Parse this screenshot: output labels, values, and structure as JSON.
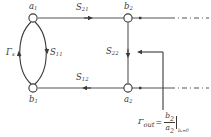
{
  "figure": {
    "type": "signal-flow-graph",
    "title": "",
    "nodes": [
      {
        "id": "a1",
        "label": "a",
        "sub": "1",
        "x": 33,
        "y": 18
      },
      {
        "id": "b1",
        "label": "b",
        "sub": "1",
        "x": 33,
        "y": 88
      },
      {
        "id": "b2",
        "label": "b",
        "sub": "2",
        "x": 128,
        "y": 18
      },
      {
        "id": "a2",
        "label": "a",
        "sub": "2",
        "x": 128,
        "y": 88
      }
    ],
    "branches": [
      {
        "id": "gamma_s",
        "label": "Γ",
        "sub": "s",
        "from": "b1",
        "to": "a1",
        "shape": "arc-left"
      },
      {
        "id": "s11",
        "label": "S",
        "sub": "11",
        "from": "a1",
        "to": "b1",
        "shape": "arc-right"
      },
      {
        "id": "s21",
        "label": "S",
        "sub": "21",
        "from": "a1",
        "to": "b2",
        "shape": "line-top"
      },
      {
        "id": "s12",
        "label": "S",
        "sub": "12",
        "from": "a2",
        "to": "b1",
        "shape": "line-bottom"
      },
      {
        "id": "s22",
        "label": "S",
        "sub": "22",
        "from": "b2",
        "to": "a2",
        "shape": "line-vertical"
      }
    ],
    "terminations": [
      {
        "id": "port-top",
        "style": "dash-dot",
        "from_x": 128,
        "to_x": 211,
        "y": 18
      },
      {
        "id": "port-bottom",
        "style": "dash-dot",
        "from_x": 128,
        "to_x": 211,
        "y": 88
      }
    ],
    "callout": {
      "arrow_direction": "left",
      "arrow_y": 52,
      "gamma": "Γ",
      "gamma_sub": "out",
      "equals": "=",
      "numerator": "b",
      "numerator_sub": "2",
      "denominator": "a",
      "denominator_sub": "2",
      "condition": "bₛ=0"
    },
    "colors": {
      "line": "#555555",
      "curve": "#3a3a3a",
      "node_stroke": "#3a3a3a",
      "node_fill": "#ffffff",
      "text": "#3a3a3a",
      "background": "#ffffff"
    }
  }
}
